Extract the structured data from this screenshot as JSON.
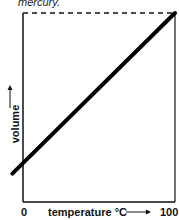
{
  "caption": "mercury.",
  "chart_data": {
    "type": "line",
    "title": "",
    "xlabel": "temperature °C",
    "ylabel": "volume",
    "x_ticks": [
      "0",
      "100"
    ],
    "xlim": [
      0,
      100
    ],
    "series": [
      {
        "name": "volume of mercury",
        "x": [
          -7,
          100
        ],
        "y": [
          0.15,
          1.0
        ]
      }
    ],
    "reference_line": {
      "type": "dashed-horizontal",
      "y": 1.0
    },
    "ylim": [
      0,
      1.0
    ],
    "grid": false,
    "legend": "none"
  },
  "arrows": {
    "x": "→",
    "y": "↑"
  }
}
